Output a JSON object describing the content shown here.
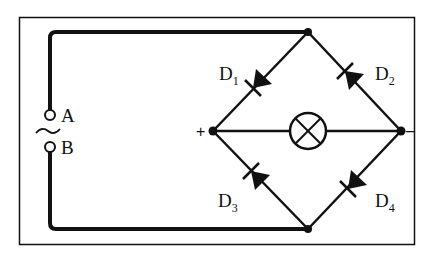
{
  "diagram": {
    "type": "bridge rectifier circuit",
    "terminals": [
      {
        "id": "A",
        "label": "A"
      },
      {
        "id": "B",
        "label": "B"
      }
    ],
    "source_symbol": "~",
    "polarity": {
      "positive": "+",
      "negative": "–"
    },
    "diodes": [
      {
        "id": "D1",
        "main": "D",
        "sub": "1",
        "position": "top-left",
        "direction": "toward left node (+)"
      },
      {
        "id": "D2",
        "main": "D",
        "sub": "2",
        "position": "top-right",
        "direction": "toward top node"
      },
      {
        "id": "D3",
        "main": "D",
        "sub": "3",
        "position": "bottom-left",
        "direction": "toward left node (+)"
      },
      {
        "id": "D4",
        "main": "D",
        "sub": "4",
        "position": "bottom-right",
        "direction": "toward bottom node"
      }
    ],
    "load": {
      "type": "lamp",
      "icon": "lamp-icon"
    },
    "colors": {
      "line": "#111111",
      "background": "#ffffff"
    }
  }
}
